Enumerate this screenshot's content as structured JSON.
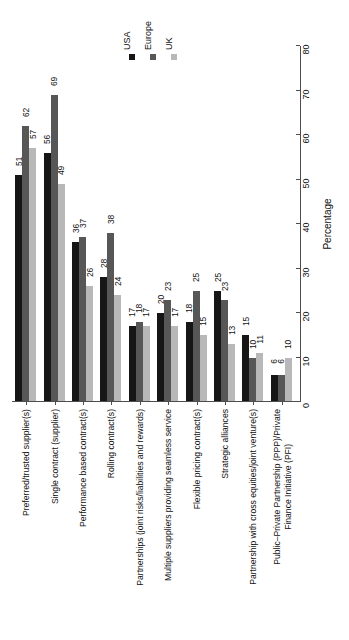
{
  "chart_data": {
    "type": "bar",
    "title": "",
    "subtitle": "",
    "xlabel": "",
    "ylabel": "Percentage",
    "ylim": [
      0,
      80
    ],
    "yticks": [
      0,
      10,
      20,
      30,
      40,
      50,
      60,
      70,
      80
    ],
    "grid": false,
    "legend_position": "top",
    "orientation": "vertical-bars-rotated-labels",
    "categories": [
      "Preferred/trusted supplier(s)",
      "Single contract (supplier)",
      "Performance based contract(s)",
      "Rolling contract(s)",
      "Partnerships (joint risks/liabilities and rewards)",
      "Multiple suppliers providing seamless service",
      "Flexible pricing contract(s)",
      "Strategic alliances",
      "Partnership with cross equities/joint venture(s)",
      "Public–Private Partnership (PPP)/Private Finance Initiative (PFI)"
    ],
    "category_lines": [
      [
        "Preferred/trusted supplier(s)"
      ],
      [
        "Single contract (supplier)"
      ],
      [
        "Performance based contract(s)"
      ],
      [
        "Rolling contract(s)"
      ],
      [
        "Partnerships (joint risks/liabilities and rewards)"
      ],
      [
        "Multiple suppliers providing seamless service"
      ],
      [
        "Flexible pricing contract(s)"
      ],
      [
        "Strategic alliances"
      ],
      [
        "Partnership with cross equities/joint venture(s)"
      ],
      [
        "Public–Private Partnership (PPP)/Private",
        "Finance Initiative (PFI)"
      ]
    ],
    "series": [
      {
        "name": "USA",
        "color": "#161616",
        "values": [
          51,
          56,
          36,
          28,
          17,
          20,
          18,
          25,
          15,
          6
        ]
      },
      {
        "name": "Europe",
        "color": "#575757",
        "values": [
          62,
          69,
          37,
          38,
          18,
          23,
          25,
          23,
          10,
          6
        ]
      },
      {
        "name": "UK",
        "color": "#b8b8b8",
        "values": [
          57,
          49,
          26,
          24,
          17,
          17,
          15,
          13,
          11,
          10
        ]
      }
    ]
  },
  "legend": {
    "items": [
      {
        "label": "USA",
        "color": "#161616"
      },
      {
        "label": "Europe",
        "color": "#575757"
      },
      {
        "label": "UK",
        "color": "#b8b8b8"
      }
    ]
  },
  "axis": {
    "value_axis_title": "Percentage",
    "tick_labels": [
      "0",
      "10",
      "20",
      "30",
      "40",
      "50",
      "60",
      "70",
      "80"
    ]
  }
}
